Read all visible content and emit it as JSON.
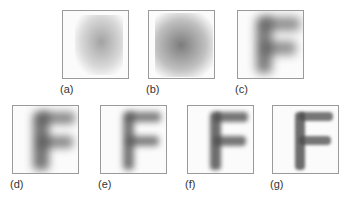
{
  "panels": [
    {
      "id": "a",
      "label": "(a)",
      "sharpness": 0.1
    },
    {
      "id": "b",
      "label": "(b)",
      "sharpness": 0.25
    },
    {
      "id": "c",
      "label": "(c)",
      "sharpness": 0.4
    },
    {
      "id": "d",
      "label": "(d)",
      "sharpness": 0.55
    },
    {
      "id": "e",
      "label": "(e)",
      "sharpness": 0.7
    },
    {
      "id": "f",
      "label": "(f)",
      "sharpness": 0.85
    },
    {
      "id": "g",
      "label": "(g)",
      "sharpness": 0.95
    }
  ],
  "subject_glyph": "F"
}
